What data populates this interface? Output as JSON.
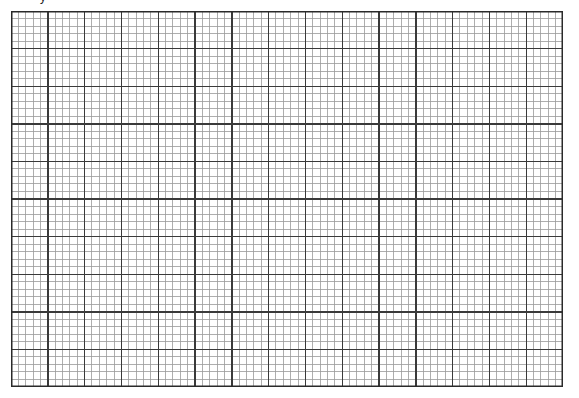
{
  "page": {
    "background": "#ffffff",
    "top_caption": "y"
  },
  "grid": {
    "x": 11,
    "y": 11,
    "width": 552,
    "height": 376,
    "major_columns": 15,
    "major_rows": 10,
    "minor_per_major": 5,
    "major_color": "#3a3a3a",
    "minor_color": "#9a9a9a",
    "border_color": "#2a2a2a",
    "major_width": 1.4,
    "minor_width": 0.8,
    "border_width": 1.5
  }
}
